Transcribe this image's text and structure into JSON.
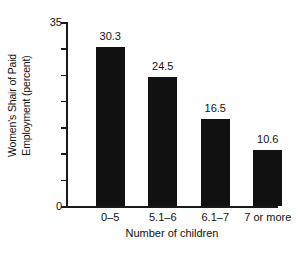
{
  "chart_data": {
    "type": "bar",
    "title": "",
    "subtitle": "",
    "categories": [
      "0–5",
      "5.1–6",
      "6.1–7",
      "7 or more"
    ],
    "values": [
      30.3,
      24.5,
      16.5,
      10.6
    ],
    "value_labels": [
      "30.3",
      "24.5",
      "16.5",
      "10.6"
    ],
    "xlabel": "Number of children",
    "ylabel": "Women's Shair of Paid Employment (percent)",
    "ylabel_line1": "Women's Shair of Paid",
    "ylabel_line2": "Employment (percent)",
    "ylim": [
      0,
      35
    ],
    "ytick_values": [
      0,
      5,
      10,
      15,
      20,
      25,
      30,
      35
    ],
    "ytick_labels_shown": [
      "0",
      "35"
    ],
    "ytick_label_min": "0",
    "ytick_label_max": "35",
    "grid": false,
    "legend": null,
    "legend_position": "none",
    "bar_color": "#111111",
    "axis_color": "#1a1a1a",
    "background_color": "#fefefe",
    "text_color": "#111111",
    "annotations": []
  }
}
